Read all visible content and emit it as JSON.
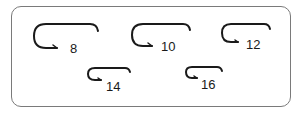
{
  "diagram": {
    "hooks": [
      {
        "size": "8",
        "label": "8"
      },
      {
        "size": "10",
        "label": "10"
      },
      {
        "size": "12",
        "label": "12"
      },
      {
        "size": "14",
        "label": "14"
      },
      {
        "size": "16",
        "label": "16"
      }
    ],
    "colors": {
      "stroke": "#1a1a1a",
      "frame": "#7a7a7a",
      "background": "#ffffff"
    }
  }
}
